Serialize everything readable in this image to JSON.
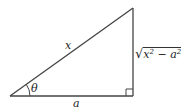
{
  "diagram": {
    "type": "right-triangle",
    "stroke_color": "#444444",
    "labels": {
      "hypotenuse": "x",
      "angle": "θ",
      "adjacent": "a",
      "opposite_radicand_x": "x",
      "opposite_radicand_minus": " − ",
      "opposite_radicand_a": "a",
      "exponent": "2",
      "sqrt_symbol": "√"
    },
    "opposite_full": "√(x² − a²)",
    "right_angle_marker": true
  }
}
